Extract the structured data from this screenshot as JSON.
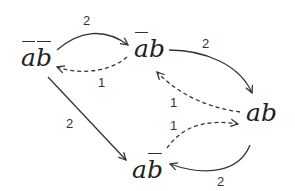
{
  "diagram": {
    "type": "state-transition-graph",
    "colors": {
      "stroke": "#333333",
      "text": "#222222",
      "background": "#ffffff"
    },
    "nodes": [
      {
        "id": "n1",
        "chars": [
          "a",
          "b"
        ],
        "overbar": [
          true,
          true
        ],
        "display": "a̅b̅"
      },
      {
        "id": "n2",
        "chars": [
          "a",
          "b"
        ],
        "overbar": [
          true,
          false
        ],
        "display": "a̅b"
      },
      {
        "id": "n3",
        "chars": [
          "a",
          "b"
        ],
        "overbar": [
          false,
          false
        ],
        "display": "ab"
      },
      {
        "id": "n4",
        "chars": [
          "a",
          "b"
        ],
        "overbar": [
          false,
          true
        ],
        "display": "ab̅"
      }
    ],
    "edges": [
      {
        "from": "n1",
        "to": "n2",
        "label": "2",
        "style": "solid"
      },
      {
        "from": "n2",
        "to": "n1",
        "label": "1",
        "style": "dashed"
      },
      {
        "from": "n2",
        "to": "n3",
        "label": "2",
        "style": "solid"
      },
      {
        "from": "n3",
        "to": "n2",
        "label": "1",
        "style": "dashed"
      },
      {
        "from": "n1",
        "to": "n4",
        "label": "2",
        "style": "solid"
      },
      {
        "from": "n4",
        "to": "n3",
        "label": "1",
        "style": "dashed"
      },
      {
        "from": "n3",
        "to": "n4",
        "label": "2",
        "style": "solid"
      }
    ]
  }
}
